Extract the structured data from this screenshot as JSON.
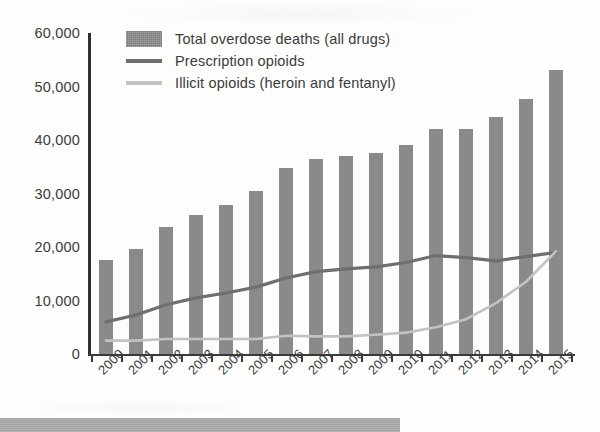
{
  "legend": {
    "items": [
      {
        "label": "Total overdose deaths (all drugs)",
        "marker": "bar-swatch",
        "color": "#8a8a8a"
      },
      {
        "label": "Prescription opioids",
        "marker": "line-swatch",
        "color": "#6f6f6f"
      },
      {
        "label": "Illicit opioids (heroin and fentanyl)",
        "marker": "line-swatch",
        "color": "#c2c2c2"
      }
    ]
  },
  "footer": {
    "text": ""
  },
  "chart_data": {
    "type": "bar",
    "title": "",
    "subtitle": "",
    "xlabel": "",
    "ylabel": "",
    "categories": [
      "2000",
      "2001",
      "2002",
      "2003",
      "2004",
      "2005",
      "2006",
      "2007",
      "2008",
      "2009",
      "2010",
      "2011",
      "2012",
      "2013",
      "2014",
      "2015"
    ],
    "ylim": [
      0,
      60000
    ],
    "ytick_labels": [
      "0",
      "10,000",
      "20,000",
      "30,000",
      "40,000",
      "50,000",
      "60,000"
    ],
    "ytick_values": [
      0,
      10000,
      20000,
      30000,
      40000,
      50000,
      60000
    ],
    "grid": false,
    "legend_position": "top-left",
    "series": [
      {
        "name": "Total overdose deaths (all drugs)",
        "type": "bar",
        "color": "#8a8a8a",
        "values": [
          17500,
          19700,
          23800,
          26000,
          27900,
          30500,
          34800,
          36500,
          37000,
          37500,
          39100,
          42000,
          42000,
          44300,
          47700,
          53000
        ]
      },
      {
        "name": "Prescription opioids",
        "type": "line",
        "color": "#6f6f6f",
        "values": [
          6000,
          7300,
          9200,
          10500,
          11400,
          12500,
          14200,
          15400,
          15900,
          16300,
          17100,
          18400,
          18000,
          17400,
          18200,
          19000
        ]
      },
      {
        "name": "Illicit opioids (heroin and fentanyl)",
        "type": "line",
        "color": "#c2c2c2",
        "values": [
          2500,
          2500,
          2800,
          2800,
          2800,
          2800,
          3400,
          3300,
          3300,
          3600,
          4000,
          5000,
          6500,
          9500,
          13500,
          19200
        ]
      }
    ]
  }
}
